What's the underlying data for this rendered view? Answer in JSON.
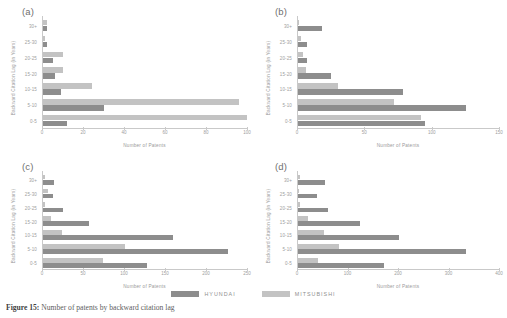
{
  "figure": {
    "caption_prefix": "Figure 15:",
    "caption_text": "Number of patents by backward citation lag",
    "legend": [
      {
        "label": "HYUNDAI",
        "color": "#8d8d8d"
      },
      {
        "label": "MITSUBISHI",
        "color": "#c3c3c3"
      }
    ]
  },
  "chart_data": [
    {
      "type": "bar",
      "title": "(a)",
      "orientation": "horizontal",
      "xlabel": "Number of Patents",
      "ylabel": "Backward Citation Lag (in Years)",
      "categories": [
        "0-5",
        "5-10",
        "10-15",
        "15-20",
        "20-25",
        "25-30",
        "30+"
      ],
      "xlim": [
        0,
        100
      ],
      "xticks": [
        0,
        20,
        40,
        60,
        80,
        100
      ],
      "grid": false,
      "legend_position": "bottom",
      "series": [
        {
          "name": "HYUNDAI",
          "color": "#8d8d8d",
          "values": [
            12,
            30,
            9,
            6,
            5,
            2,
            2
          ]
        },
        {
          "name": "MITSUBISHI",
          "color": "#c3c3c3",
          "values": [
            101,
            96,
            24,
            10,
            10,
            1,
            2
          ]
        }
      ]
    },
    {
      "type": "bar",
      "title": "(b)",
      "orientation": "horizontal",
      "xlabel": "Number of Patents",
      "ylabel": "Backward Citation Lag (in Years)",
      "categories": [
        "0-5",
        "5-10",
        "10-15",
        "15-20",
        "20-25",
        "25-30",
        "30+"
      ],
      "xlim": [
        0,
        150
      ],
      "xticks": [
        0,
        50,
        100,
        150
      ],
      "grid": false,
      "legend_position": "bottom",
      "series": [
        {
          "name": "HYUNDAI",
          "color": "#8d8d8d",
          "values": [
            95,
            125,
            78,
            25,
            7,
            7,
            18
          ]
        },
        {
          "name": "MITSUBISHI",
          "color": "#c3c3c3",
          "values": [
            92,
            72,
            30,
            6,
            4,
            2,
            1
          ]
        }
      ]
    },
    {
      "type": "bar",
      "title": "(c)",
      "orientation": "horizontal",
      "xlabel": "Number of Patents",
      "ylabel": "Backward Citation Lag (in Years)",
      "categories": [
        "0-5",
        "5-10",
        "10-15",
        "15-20",
        "20-25",
        "25-30",
        "30+"
      ],
      "xlim": [
        0,
        250
      ],
      "xticks": [
        0,
        50,
        100,
        150,
        200,
        250
      ],
      "grid": false,
      "legend_position": "bottom",
      "series": [
        {
          "name": "HYUNDAI",
          "color": "#8d8d8d",
          "values": [
            128,
            227,
            159,
            56,
            25,
            12,
            14
          ]
        },
        {
          "name": "MITSUBISHI",
          "color": "#c3c3c3",
          "values": [
            74,
            100,
            23,
            10,
            2,
            6,
            3
          ]
        }
      ]
    },
    {
      "type": "bar",
      "title": "(d)",
      "orientation": "horizontal",
      "xlabel": "Number of Patents",
      "ylabel": "Backward Citation Lag (in Years)",
      "categories": [
        "0-5",
        "5-10",
        "10-15",
        "15-20",
        "20-25",
        "25-30",
        "30+"
      ],
      "xlim": [
        0,
        400
      ],
      "xticks": [
        0,
        100,
        200,
        300,
        400
      ],
      "grid": false,
      "legend_position": "bottom",
      "series": [
        {
          "name": "HYUNDAI",
          "color": "#8d8d8d",
          "values": [
            172,
            335,
            200,
            124,
            60,
            38,
            53
          ]
        },
        {
          "name": "MITSUBISHI",
          "color": "#c3c3c3",
          "values": [
            40,
            82,
            52,
            20,
            3,
            2,
            3
          ]
        }
      ]
    }
  ]
}
